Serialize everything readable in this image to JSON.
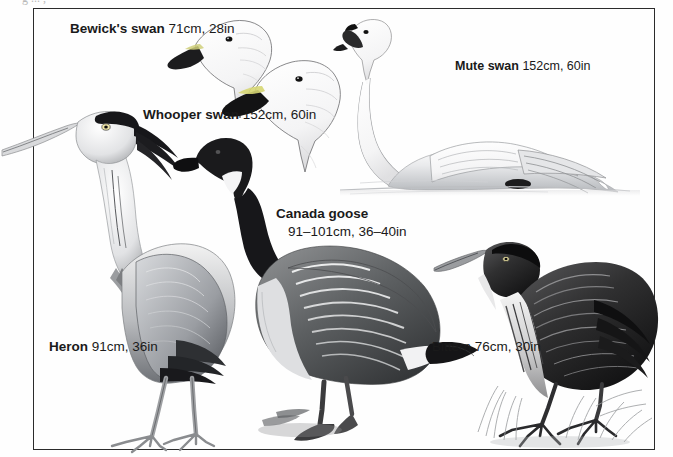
{
  "page": {
    "header_cut_text": "g ... ,",
    "background_color": "#fefefe",
    "frame_color": "#2b2b2b",
    "ink_color": "#1a1a1a"
  },
  "plate": {
    "title": "Bird identification plate",
    "birds": [
      {
        "id": "bewicks-swan",
        "species": "Bewick's swan",
        "size": "71cm, 28in",
        "illustration": "swan head in profile, white plumage, black and yellow bill"
      },
      {
        "id": "whooper-swan",
        "species": "Whooper swan",
        "size": "152cm, 60in",
        "illustration": "swan head in profile, white plumage, long black and yellow wedge bill"
      },
      {
        "id": "mute-swan",
        "species": "Mute swan",
        "size": "152cm, 60in",
        "illustration": "white swan swimming on water, curved neck, orange bill with black knob"
      },
      {
        "id": "canada-goose",
        "species": "Canada goose",
        "size": "91–101cm, 36–40in",
        "illustration": "standing goose, black neck and head with white chinstrap, brown barred body"
      },
      {
        "id": "heron",
        "species": "Heron",
        "size": "91cm, 36in",
        "illustration": "grey heron standing, long dagger bill, black crest plume, long legs"
      },
      {
        "id": "bittern",
        "species": "Bittern",
        "size": "76cm, 30in",
        "illustration": "streaked brown bittern crouching in reeds, long toes gripping grass"
      }
    ]
  }
}
